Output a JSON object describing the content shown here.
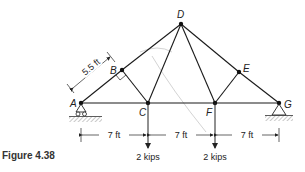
{
  "figure": {
    "caption": "Figure 4.38"
  },
  "truss": {
    "joints": [
      {
        "id": "A",
        "label": "A",
        "x": 81,
        "y": 103
      },
      {
        "id": "B",
        "label": "B",
        "x": 122,
        "y": 70
      },
      {
        "id": "C",
        "label": "C",
        "x": 148,
        "y": 103
      },
      {
        "id": "D",
        "label": "D",
        "x": 181,
        "y": 24
      },
      {
        "id": "E",
        "label": "E",
        "x": 239,
        "y": 72
      },
      {
        "id": "F",
        "label": "F",
        "x": 215,
        "y": 103
      },
      {
        "id": "G",
        "label": "G",
        "x": 279,
        "y": 103
      }
    ],
    "members": [
      "AB",
      "BD",
      "DE",
      "EG",
      "AC",
      "CF",
      "FG",
      "BC",
      "CD",
      "DF",
      "EF"
    ],
    "supports": {
      "A": "roller",
      "G": "pin"
    }
  },
  "dimensions": {
    "ab_length": "5.5 ft",
    "span_ac": "7 ft",
    "span_cf": "7 ft",
    "span_fg": "7 ft"
  },
  "loads": {
    "at_c": "2 kips",
    "at_f": "2 kips"
  }
}
